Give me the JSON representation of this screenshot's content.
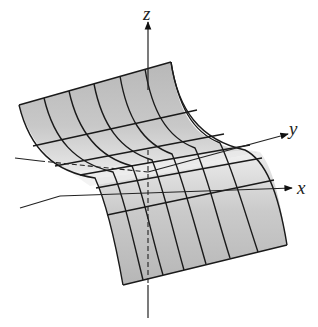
{
  "figure": {
    "type": "3d-surface-diagram",
    "surface_fill": "#c4c4c4",
    "surface_fill_light": "#e6e6e6",
    "line_color": "#1a1a1a"
  },
  "axes": {
    "z": {
      "label": "z"
    },
    "y": {
      "label": "y"
    },
    "x": {
      "label": "x"
    }
  }
}
